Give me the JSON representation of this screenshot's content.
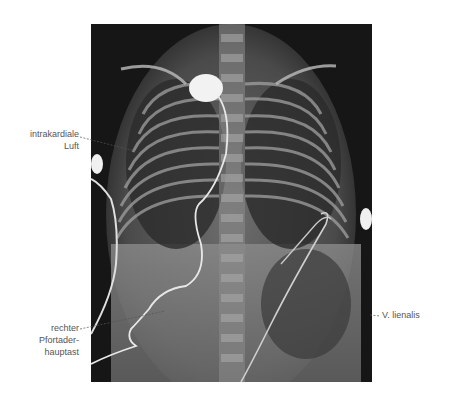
{
  "figure": {
    "labels": [
      {
        "id": "intrakardiale",
        "lines": [
          "intrakardiale",
          "Luft"
        ]
      },
      {
        "id": "pfortader",
        "lines": [
          "rechter",
          "Pfortader-",
          "hauptast"
        ]
      },
      {
        "id": "lienalis",
        "lines": [
          "V. lienalis"
        ]
      }
    ]
  }
}
